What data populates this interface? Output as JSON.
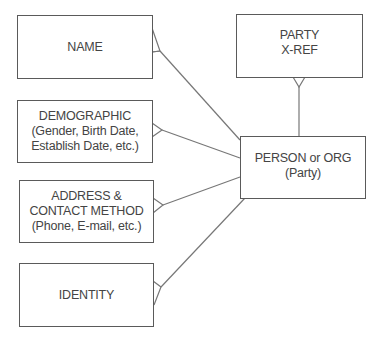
{
  "diagram": {
    "type": "entity-relationship",
    "notation": "crow's foot",
    "entities": [
      {
        "id": "name",
        "lines": [
          "NAME"
        ]
      },
      {
        "id": "party_xref",
        "lines": [
          "PARTY",
          "X-REF"
        ]
      },
      {
        "id": "demographic",
        "lines": [
          "DEMOGRAPHIC",
          "(Gender, Birth Date,",
          "Establish Date, etc.)"
        ]
      },
      {
        "id": "person_org",
        "lines": [
          "PERSON or ORG",
          "(Party)"
        ]
      },
      {
        "id": "address_contact",
        "lines": [
          "ADDRESS &",
          "CONTACT METHOD",
          "(Phone, E-mail, etc.)"
        ]
      },
      {
        "id": "identity",
        "lines": [
          "IDENTITY"
        ]
      }
    ],
    "relationships": [
      {
        "from": "person_org",
        "to": "name",
        "cardinality": "one-to-many",
        "many_end": "name"
      },
      {
        "from": "person_org",
        "to": "party_xref",
        "cardinality": "one-to-many",
        "many_end": "party_xref"
      },
      {
        "from": "person_org",
        "to": "demographic",
        "cardinality": "one-to-many",
        "many_end": "demographic"
      },
      {
        "from": "person_org",
        "to": "address_contact",
        "cardinality": "one-to-many",
        "many_end": "address_contact"
      },
      {
        "from": "person_org",
        "to": "identity",
        "cardinality": "one-to-many",
        "many_end": "identity"
      }
    ],
    "colors": {
      "border": "#5a5a5a",
      "line": "#777777",
      "text": "#444444",
      "background": "#ffffff"
    }
  }
}
